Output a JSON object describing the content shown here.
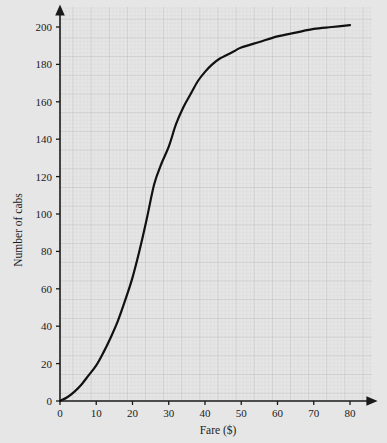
{
  "chart_data": {
    "type": "line",
    "title": "",
    "subtitle": "",
    "xlabel": "Fare ($)",
    "ylabel": "Number of cabs",
    "xlim": [
      0,
      80
    ],
    "ylim": [
      0,
      205
    ],
    "xticks": [
      0,
      10,
      20,
      30,
      40,
      50,
      60,
      70,
      80
    ],
    "yticks": [
      0,
      20,
      40,
      60,
      80,
      100,
      120,
      140,
      160,
      180,
      200
    ],
    "xtick_labels": [
      "0",
      "10",
      "20",
      "30",
      "40",
      "50",
      "60",
      "70",
      "80"
    ],
    "ytick_labels": [
      "0",
      "20",
      "40",
      "60",
      "80",
      "100",
      "120",
      "140",
      "160",
      "180",
      "200"
    ],
    "grid": true,
    "grid_style": "graph-paper",
    "grid_minor_step": 1,
    "grid_major_step": 5,
    "legend": null,
    "annotations": [],
    "series": [
      {
        "name": "Cumulative frequency of cab fares",
        "color": "#111111",
        "line_width": 2.2,
        "x": [
          0,
          2,
          4,
          6,
          8,
          10,
          12,
          14,
          16,
          18,
          20,
          22,
          24,
          26,
          28,
          30,
          32,
          34,
          36,
          38,
          40,
          42,
          44,
          46,
          48,
          50,
          55,
          60,
          65,
          70,
          75,
          80
        ],
        "values": [
          0,
          2,
          5,
          9,
          14,
          19,
          26,
          34,
          43,
          54,
          66,
          81,
          98,
          116,
          127,
          136,
          148,
          157,
          164,
          171,
          176,
          180,
          183,
          185,
          187,
          189,
          192,
          195,
          197,
          199,
          200,
          201
        ]
      }
    ]
  },
  "axis": {
    "x_axis_name": "fare-axis",
    "y_axis_name": "number-of-cabs-axis",
    "arrow_tips": true
  },
  "colors": {
    "background": "#e6e6e6",
    "grid_minor": "#d2d2d2",
    "grid_major": "#bdbdbd",
    "axis": "#1a1a1a",
    "curve": "#111111",
    "text": "#1a1a1a"
  }
}
